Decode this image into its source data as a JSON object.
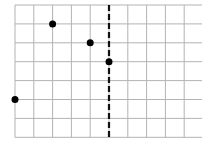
{
  "diagram": {
    "type": "grid_with_points",
    "grid": {
      "origin_px": [
        15,
        5
      ],
      "cell_w": 18.8,
      "cell_h": 18.9,
      "cols": 10,
      "rows": 7,
      "line_color": "#b3b3b3"
    },
    "dashed_line": {
      "col": 5,
      "color": "#111111"
    },
    "points": [
      {
        "col": 2,
        "row": 1
      },
      {
        "col": 4,
        "row": 2
      },
      {
        "col": 5,
        "row": 3
      },
      {
        "col": 0,
        "row": 5
      }
    ],
    "point_color": "#000000",
    "point_radius": 3.5
  }
}
